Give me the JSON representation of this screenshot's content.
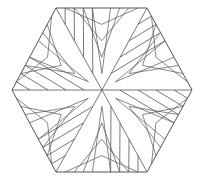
{
  "figure": {
    "shape": "hexagon",
    "stroke_color": "#555555",
    "background": "#ffffff",
    "vertices": [
      [
        56,
        8
      ],
      [
        147,
        8
      ],
      [
        192,
        90
      ],
      [
        147,
        172
      ],
      [
        56,
        172
      ],
      [
        12,
        90
      ]
    ],
    "center": [
      102,
      90
    ],
    "nested_levels": 4
  }
}
